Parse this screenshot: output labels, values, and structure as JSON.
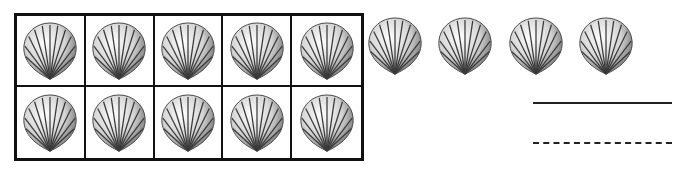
{
  "ten_frame": {
    "rows": 2,
    "columns": 5,
    "filled_cells": 10,
    "item": "scallop-shell"
  },
  "extra_shells": {
    "count": 4,
    "positions_x": [
      364,
      434,
      505,
      576
    ]
  },
  "answer_lines": {
    "solid": "",
    "dashed": ""
  },
  "total_shells": 14,
  "colors": {
    "border": "#111111",
    "background": "#ffffff",
    "shell_shade": "#8a8a8a"
  }
}
